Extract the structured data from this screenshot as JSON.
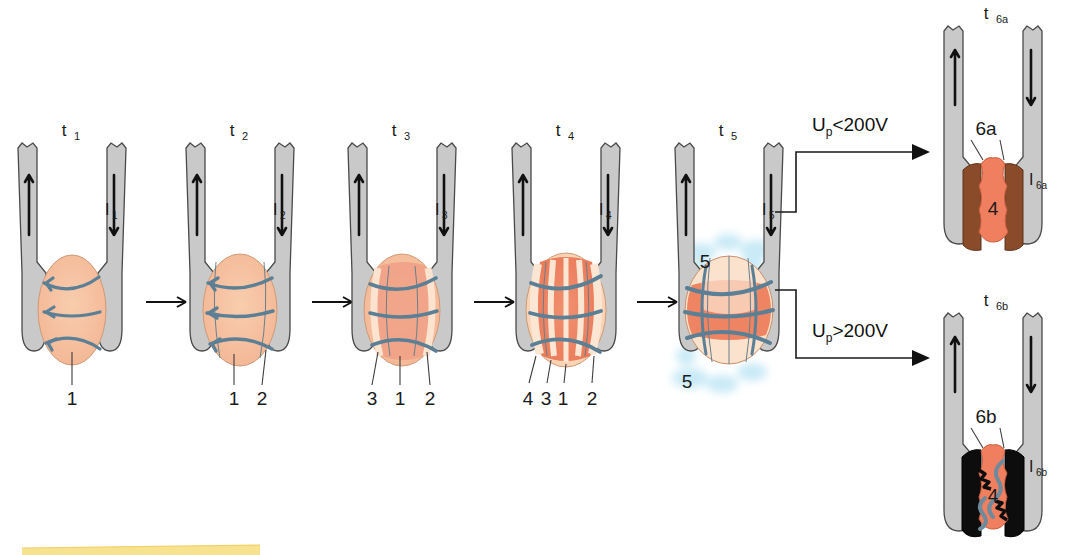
{
  "figure": {
    "type": "process-diagram",
    "background": "#ffffff"
  },
  "palette": {
    "electrode_fill": "#c9c9c9",
    "electrode_stroke": "#4a4a4a",
    "nugget_light": "#f6c6a4",
    "nugget_pale": "#fae2cd",
    "nugget_mid": "#f2a184",
    "nugget_hot": "#ef7f5e",
    "nugget_core": "#f08a64",
    "brown_zone": "#8a4b2a",
    "black_zone": "#0d0d0d",
    "flow_line": "#5b7f95",
    "spatter_blue": "#bfe6f5",
    "label_text": "#1a1a1a",
    "highlight_bar": "#f7e08a"
  },
  "stages": [
    {
      "id": "t1",
      "label": "t",
      "sub": "1",
      "current_label": "I",
      "current_sub": "1",
      "left_arrow": "up",
      "right_arrow": "down",
      "callouts": [
        "1"
      ],
      "description": "initial contact, small lens with three horizontal flow arrows"
    },
    {
      "id": "t2",
      "label": "t",
      "sub": "2",
      "current_label": "I",
      "current_sub": "2",
      "left_arrow": "up",
      "right_arrow": "down",
      "callouts": [
        "1",
        "2"
      ],
      "description": "growing nugget with corona bond forming"
    },
    {
      "id": "t3",
      "label": "t",
      "sub": "3",
      "current_label": "I",
      "current_sub": "3",
      "left_arrow": "up",
      "right_arrow": "down",
      "callouts": [
        "3",
        "1",
        "2"
      ],
      "description": "nugget with pale outer ring and blue convection bands"
    },
    {
      "id": "t4",
      "label": "t",
      "sub": "4",
      "current_label": "I",
      "current_sub": "4",
      "left_arrow": "up",
      "right_arrow": "down",
      "callouts": [
        "4",
        "3",
        "1",
        "2"
      ],
      "description": "fully developed molten nugget, hot core"
    },
    {
      "id": "t5",
      "label": "t",
      "sub": "5",
      "current_label": "I",
      "current_sub": "5",
      "left_arrow": "up",
      "right_arrow": "down",
      "callouts": [
        "5",
        "5"
      ],
      "description": "expulsion / spatter of molten metal, blue spatter clouds labelled 5"
    }
  ],
  "branches": [
    {
      "id": "t6a",
      "condition_prefix": "U",
      "condition_sub": "p",
      "condition_rest": "<200V",
      "label": "t",
      "sub": "6a",
      "current_label": "I",
      "current_sub": "6a",
      "zone_label": "6a",
      "nugget_label": "4",
      "zone_color": "brown",
      "description": "low electrode voltage: brown annular zones, intact nugget 4"
    },
    {
      "id": "t6b",
      "condition_prefix": "U",
      "condition_sub": "p",
      "condition_rest": ">200V",
      "label": "t",
      "sub": "6b",
      "current_label": "I",
      "current_sub": "6b",
      "zone_label": "6b",
      "nugget_label": "4",
      "zone_color": "black",
      "description": "high electrode voltage: black jagged zones with cracks, nugget 4"
    }
  ],
  "callout_numbers": {
    "1": "1",
    "2": "2",
    "3": "3",
    "4": "4",
    "5": "5"
  },
  "highlight_bar": {
    "present": true,
    "color": "#f7e08a",
    "x": 22,
    "y": 545,
    "width": 238,
    "height": 10
  }
}
